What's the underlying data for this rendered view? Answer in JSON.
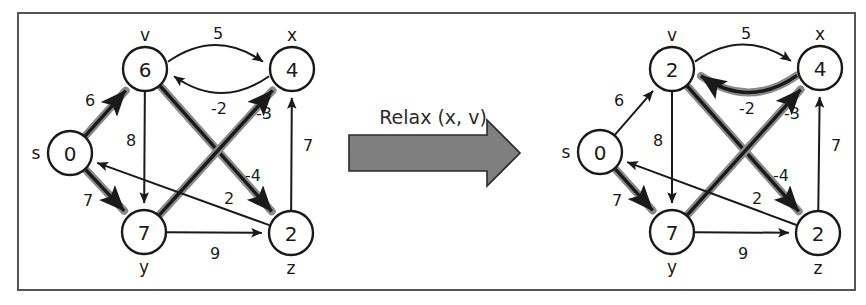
{
  "figure": {
    "frame": {
      "color": "#555555"
    },
    "transition": {
      "label": "Relax (x, v)",
      "arrow_icon": "right-arrow-icon",
      "arrow_color": "#7f7f7f"
    },
    "colors": {
      "node_fill": "#ffffff",
      "stroke": "#1a1a1a",
      "highlight": "#8a8a8a"
    }
  },
  "graphs": [
    {
      "id": "before",
      "caption": "before relax",
      "nodes": [
        {
          "id": "s",
          "name": "s",
          "value": "0",
          "cx": 70,
          "cy": 153,
          "r": 22,
          "label_dx": -34,
          "label_dy": 0
        },
        {
          "id": "v",
          "name": "v",
          "value": "6",
          "cx": 145,
          "cy": 69,
          "r": 22,
          "label_dx": 0,
          "label_dy": -34
        },
        {
          "id": "x",
          "name": "x",
          "value": "4",
          "cx": 292,
          "cy": 69,
          "r": 22,
          "label_dx": 0,
          "label_dy": -34
        },
        {
          "id": "y",
          "name": "y",
          "value": "7",
          "cx": 144,
          "cy": 232,
          "r": 22,
          "label_dx": 0,
          "label_dy": 35
        },
        {
          "id": "z",
          "name": "z",
          "value": "2",
          "cx": 291,
          "cy": 233,
          "r": 22,
          "label_dx": 0,
          "label_dy": 35
        }
      ],
      "edges": [
        {
          "from": "s",
          "to": "v",
          "weight": "6",
          "highlight": true,
          "lx": 90,
          "ly": 100,
          "curve": 0
        },
        {
          "from": "s",
          "to": "y",
          "weight": "7",
          "highlight": true,
          "lx": 88,
          "ly": 200,
          "curve": 0
        },
        {
          "from": "v",
          "to": "x",
          "weight": "5",
          "highlight": false,
          "lx": 218,
          "ly": 33,
          "curve": -16
        },
        {
          "from": "x",
          "to": "v",
          "weight": "-2",
          "highlight": false,
          "lx": 219,
          "ly": 108,
          "curve": -16
        },
        {
          "from": "v",
          "to": "y",
          "weight": "8",
          "highlight": false,
          "lx": 131,
          "ly": 140,
          "curve": 0
        },
        {
          "from": "v",
          "to": "z",
          "weight": "-4",
          "highlight": true,
          "lx": 253,
          "ly": 175,
          "curve": 0
        },
        {
          "from": "y",
          "to": "x",
          "weight": "-3",
          "highlight": true,
          "lx": 264,
          "ly": 113,
          "curve": 0
        },
        {
          "from": "y",
          "to": "z",
          "weight": "9",
          "highlight": false,
          "lx": 215,
          "ly": 253,
          "curve": 0
        },
        {
          "from": "z",
          "to": "x",
          "weight": "7",
          "highlight": false,
          "lx": 308,
          "ly": 145,
          "curve": 0
        },
        {
          "from": "z",
          "to": "s",
          "weight": "2",
          "highlight": false,
          "lx": 229,
          "ly": 198,
          "curve": 0
        }
      ]
    },
    {
      "id": "after",
      "caption": "after relax",
      "nodes": [
        {
          "id": "s",
          "name": "s",
          "value": "0",
          "cx": 600,
          "cy": 152,
          "r": 22,
          "label_dx": -34,
          "label_dy": 0
        },
        {
          "id": "v",
          "name": "v",
          "value": "2",
          "cx": 672,
          "cy": 69,
          "r": 22,
          "label_dx": 0,
          "label_dy": -34
        },
        {
          "id": "x",
          "name": "x",
          "value": "4",
          "cx": 820,
          "cy": 68,
          "r": 22,
          "label_dx": 0,
          "label_dy": -34
        },
        {
          "id": "y",
          "name": "y",
          "value": "7",
          "cx": 672,
          "cy": 232,
          "r": 22,
          "label_dx": 0,
          "label_dy": 35
        },
        {
          "id": "z",
          "name": "z",
          "value": "2",
          "cx": 818,
          "cy": 233,
          "r": 22,
          "label_dx": 0,
          "label_dy": 35
        }
      ],
      "edges": [
        {
          "from": "s",
          "to": "v",
          "weight": "6",
          "highlight": false,
          "lx": 619,
          "ly": 100,
          "curve": 0
        },
        {
          "from": "s",
          "to": "y",
          "weight": "7",
          "highlight": true,
          "lx": 617,
          "ly": 200,
          "curve": 0
        },
        {
          "from": "v",
          "to": "x",
          "weight": "5",
          "highlight": false,
          "lx": 746,
          "ly": 33,
          "curve": -16
        },
        {
          "from": "x",
          "to": "v",
          "weight": "-2",
          "highlight": true,
          "lx": 747,
          "ly": 108,
          "curve": -16
        },
        {
          "from": "v",
          "to": "y",
          "weight": "8",
          "highlight": false,
          "lx": 658,
          "ly": 140,
          "curve": 0
        },
        {
          "from": "v",
          "to": "z",
          "weight": "-4",
          "highlight": true,
          "lx": 781,
          "ly": 175,
          "curve": 0
        },
        {
          "from": "y",
          "to": "x",
          "weight": "-3",
          "highlight": true,
          "lx": 792,
          "ly": 113,
          "curve": 0
        },
        {
          "from": "y",
          "to": "z",
          "weight": "9",
          "highlight": false,
          "lx": 743,
          "ly": 253,
          "curve": 0
        },
        {
          "from": "z",
          "to": "x",
          "weight": "7",
          "highlight": false,
          "lx": 836,
          "ly": 145,
          "curve": 0
        },
        {
          "from": "z",
          "to": "s",
          "weight": "2",
          "highlight": false,
          "lx": 757,
          "ly": 198,
          "curve": 0
        }
      ]
    }
  ]
}
